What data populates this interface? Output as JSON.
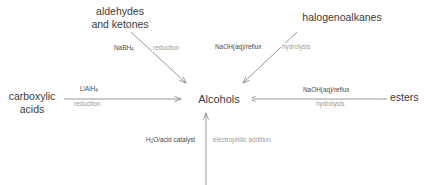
{
  "diagram": {
    "center": {
      "label": "Alcohols"
    },
    "colors": {
      "background": "#ffffff",
      "node_text": "#3c3c3c",
      "reagent_text": "#4a4a4a",
      "reaction_type_text": "#9a9a9a",
      "arrow": "#8c8c8c"
    },
    "nodes": [
      {
        "id": "aldehydes-ketones",
        "label": "aldehydes\nand ketones",
        "position": "top-left"
      },
      {
        "id": "halogenoalkanes",
        "label": "halogenoalkanes",
        "position": "top-right"
      },
      {
        "id": "carboxylic-acids",
        "label": "carboxylic\nacids",
        "position": "left"
      },
      {
        "id": "esters",
        "label": "esters",
        "position": "right"
      },
      {
        "id": "alkenes",
        "label": "",
        "position": "bottom"
      }
    ],
    "arrows": [
      {
        "id": "aldehydes-to-alcohols",
        "from": "aldehydes-ketones",
        "to": "alcohols",
        "reagent": "NaBH",
        "reagent_subscript": "4",
        "reaction_type": "reduction",
        "direction": "diagonal-down-right"
      },
      {
        "id": "halogenoalkanes-to-alcohols",
        "from": "halogenoalkanes",
        "to": "alcohols",
        "reagent": "NaOH(aq)/reflux",
        "reagent_subscript": "",
        "reaction_type": "hydrolysis",
        "direction": "diagonal-down-left"
      },
      {
        "id": "carboxylic-to-alcohols",
        "from": "carboxylic-acids",
        "to": "alcohols",
        "reagent": "LiAlH",
        "reagent_subscript": "4",
        "reaction_type": "reduction",
        "direction": "right"
      },
      {
        "id": "esters-to-alcohols",
        "from": "esters",
        "to": "alcohols",
        "reagent": "NaOH(aq)/reflux",
        "reagent_subscript": "",
        "reaction_type": "hydrolysis",
        "direction": "left"
      },
      {
        "id": "alkenes-to-alcohols",
        "from": "alkenes",
        "to": "alcohols",
        "reagent": "H O/acid catalyst",
        "reagent_prefix": "H",
        "reagent_subscript": "2",
        "reagent_suffix": "O/acid catalyst",
        "reaction_type": "electrophilic addition",
        "direction": "up"
      }
    ]
  }
}
